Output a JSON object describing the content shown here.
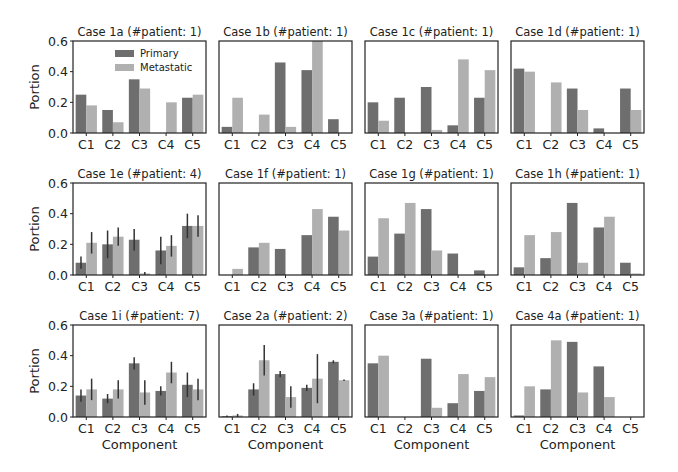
{
  "figure": {
    "xlabel": "Component",
    "ylabel": "Portion",
    "yticks": [
      "0.0",
      "0.2",
      "0.4",
      "0.6"
    ],
    "legend": {
      "items": [
        "Primary",
        "Metastatic"
      ],
      "position": "upper right of first panel"
    },
    "colors": {
      "primary": "#6e6e6e",
      "metastatic": "#b0b0b0",
      "errorbar": "#333333",
      "frame": "#222222"
    }
  },
  "chart_data": [
    {
      "type": "bar",
      "title": "Case 1a (#patient: 1)",
      "categories": [
        "C1",
        "C2",
        "C3",
        "C4",
        "C5"
      ],
      "series": [
        {
          "name": "Primary",
          "values": [
            0.25,
            0.15,
            0.35,
            0.0,
            0.23
          ]
        },
        {
          "name": "Metastatic",
          "values": [
            0.18,
            0.07,
            0.29,
            0.2,
            0.25
          ]
        }
      ],
      "ylim": [
        0,
        0.6
      ],
      "xlabel": "",
      "ylabel": "Portion",
      "legend": true
    },
    {
      "type": "bar",
      "title": "Case 1b (#patient: 1)",
      "categories": [
        "C1",
        "C2",
        "C3",
        "C4",
        "C5"
      ],
      "series": [
        {
          "name": "Primary",
          "values": [
            0.04,
            0.0,
            0.46,
            0.41,
            0.09
          ]
        },
        {
          "name": "Metastatic",
          "values": [
            0.23,
            0.12,
            0.04,
            0.6,
            0.0
          ]
        }
      ],
      "ylim": [
        0,
        0.6
      ]
    },
    {
      "type": "bar",
      "title": "Case 1c (#patient: 1)",
      "categories": [
        "C1",
        "C2",
        "C3",
        "C4",
        "C5"
      ],
      "series": [
        {
          "name": "Primary",
          "values": [
            0.2,
            0.23,
            0.3,
            0.05,
            0.23
          ]
        },
        {
          "name": "Metastatic",
          "values": [
            0.08,
            0.0,
            0.02,
            0.48,
            0.41
          ]
        }
      ],
      "ylim": [
        0,
        0.6
      ]
    },
    {
      "type": "bar",
      "title": "Case 1d (#patient: 1)",
      "categories": [
        "C1",
        "C2",
        "C3",
        "C4",
        "C5"
      ],
      "series": [
        {
          "name": "Primary",
          "values": [
            0.42,
            0.0,
            0.29,
            0.03,
            0.29
          ]
        },
        {
          "name": "Metastatic",
          "values": [
            0.4,
            0.33,
            0.15,
            0.0,
            0.15
          ]
        }
      ],
      "ylim": [
        0,
        0.6
      ]
    },
    {
      "type": "bar",
      "title": "Case 1e (#patient: 4)",
      "categories": [
        "C1",
        "C2",
        "C3",
        "C4",
        "C5"
      ],
      "series": [
        {
          "name": "Primary",
          "values": [
            0.08,
            0.2,
            0.23,
            0.16,
            0.32
          ],
          "err": [
            0.04,
            0.09,
            0.07,
            0.09,
            0.08
          ]
        },
        {
          "name": "Metastatic",
          "values": [
            0.21,
            0.25,
            0.01,
            0.19,
            0.32
          ],
          "err": [
            0.07,
            0.06,
            0.01,
            0.07,
            0.07
          ]
        }
      ],
      "ylim": [
        0,
        0.6
      ],
      "ylabel": "Portion"
    },
    {
      "type": "bar",
      "title": "Case 1f (#patient: 1)",
      "categories": [
        "C1",
        "C2",
        "C3",
        "C4",
        "C5"
      ],
      "series": [
        {
          "name": "Primary",
          "values": [
            0.0,
            0.18,
            0.17,
            0.26,
            0.38
          ]
        },
        {
          "name": "Metastatic",
          "values": [
            0.04,
            0.21,
            0.0,
            0.43,
            0.29
          ]
        }
      ],
      "ylim": [
        0,
        0.6
      ]
    },
    {
      "type": "bar",
      "title": "Case 1g (#patient: 1)",
      "categories": [
        "C1",
        "C2",
        "C3",
        "C4",
        "C5"
      ],
      "series": [
        {
          "name": "Primary",
          "values": [
            0.12,
            0.27,
            0.43,
            0.14,
            0.03
          ]
        },
        {
          "name": "Metastatic",
          "values": [
            0.37,
            0.47,
            0.16,
            0.0,
            0.0
          ]
        }
      ],
      "ylim": [
        0,
        0.6
      ]
    },
    {
      "type": "bar",
      "title": "Case 1h (#patient: 1)",
      "categories": [
        "C1",
        "C2",
        "C3",
        "C4",
        "C5"
      ],
      "series": [
        {
          "name": "Primary",
          "values": [
            0.05,
            0.11,
            0.47,
            0.31,
            0.08
          ]
        },
        {
          "name": "Metastatic",
          "values": [
            0.26,
            0.28,
            0.08,
            0.38,
            0.01
          ]
        }
      ],
      "ylim": [
        0,
        0.6
      ]
    },
    {
      "type": "bar",
      "title": "Case 1i (#patient: 7)",
      "categories": [
        "C1",
        "C2",
        "C3",
        "C4",
        "C5"
      ],
      "series": [
        {
          "name": "Primary",
          "values": [
            0.14,
            0.12,
            0.35,
            0.17,
            0.21
          ],
          "err": [
            0.04,
            0.03,
            0.04,
            0.03,
            0.08
          ]
        },
        {
          "name": "Metastatic",
          "values": [
            0.18,
            0.18,
            0.16,
            0.29,
            0.18
          ],
          "err": [
            0.07,
            0.06,
            0.08,
            0.07,
            0.07
          ]
        }
      ],
      "ylim": [
        0,
        0.6
      ],
      "xlabel": "Component",
      "ylabel": "Portion"
    },
    {
      "type": "bar",
      "title": "Case 2a (#patient: 2)",
      "categories": [
        "C1",
        "C2",
        "C3",
        "C4",
        "C5"
      ],
      "series": [
        {
          "name": "Primary",
          "values": [
            0.005,
            0.18,
            0.28,
            0.19,
            0.36
          ],
          "err": [
            0.005,
            0.04,
            0.02,
            0.02,
            0.01
          ]
        },
        {
          "name": "Metastatic",
          "values": [
            0.01,
            0.37,
            0.13,
            0.25,
            0.24
          ],
          "err": [
            0.01,
            0.1,
            0.07,
            0.16,
            0.005
          ]
        }
      ],
      "ylim": [
        0,
        0.6
      ],
      "xlabel": "Component"
    },
    {
      "type": "bar",
      "title": "Case 3a (#patient: 1)",
      "categories": [
        "C1",
        "C2",
        "C3",
        "C4",
        "C5"
      ],
      "series": [
        {
          "name": "Primary",
          "values": [
            0.35,
            0.0,
            0.38,
            0.09,
            0.17
          ]
        },
        {
          "name": "Metastatic",
          "values": [
            0.4,
            0.0,
            0.06,
            0.28,
            0.26
          ]
        }
      ],
      "ylim": [
        0,
        0.6
      ],
      "xlabel": "Component"
    },
    {
      "type": "bar",
      "title": "Case 4a (#patient: 1)",
      "categories": [
        "C1",
        "C2",
        "C3",
        "C4",
        "C5"
      ],
      "series": [
        {
          "name": "Primary",
          "values": [
            0.01,
            0.18,
            0.49,
            0.33,
            0.0
          ]
        },
        {
          "name": "Metastatic",
          "values": [
            0.2,
            0.5,
            0.16,
            0.13,
            0.0
          ]
        }
      ],
      "ylim": [
        0,
        0.6
      ],
      "xlabel": "Component"
    }
  ]
}
